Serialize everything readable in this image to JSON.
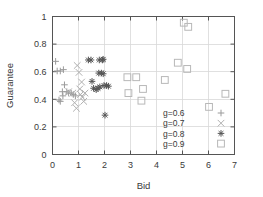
{
  "chart_data": {
    "type": "scatter",
    "title": "",
    "xlabel": "Bid",
    "ylabel": "Guarantee",
    "xlim": [
      0,
      7
    ],
    "ylim": [
      0,
      1
    ],
    "xticks": [
      "0",
      "1",
      "2",
      "3",
      "4",
      "5",
      "6",
      "7"
    ],
    "xtick_values": [
      0,
      1,
      2,
      3,
      4,
      5,
      6,
      7
    ],
    "yticks": [
      "0",
      "0.2",
      "0.4",
      "0.6",
      "0.8",
      "1"
    ],
    "ytick_values": [
      0,
      0.2,
      0.4,
      0.6,
      0.8,
      1
    ],
    "grid": true,
    "legend_position": "lower right",
    "series": [
      {
        "name": "g=0.6",
        "marker": "plus",
        "color": "#9a9a9a",
        "points": [
          [
            0.12,
            0.675
          ],
          [
            0.18,
            0.605
          ],
          [
            0.3,
            0.605
          ],
          [
            0.25,
            0.395
          ],
          [
            0.3,
            0.385
          ],
          [
            0.42,
            0.615
          ],
          [
            0.38,
            0.455
          ],
          [
            0.4,
            0.425
          ],
          [
            0.46,
            0.505
          ],
          [
            0.55,
            0.455
          ],
          [
            0.62,
            0.445
          ],
          [
            0.72,
            0.445
          ],
          [
            0.8,
            0.435
          ],
          [
            0.88,
            0.425
          ]
        ]
      },
      {
        "name": "g=0.7",
        "marker": "cross",
        "color": "#b0b0b0",
        "points": [
          [
            0.62,
            0.455
          ],
          [
            0.78,
            0.445
          ],
          [
            0.85,
            0.375
          ],
          [
            0.92,
            0.335
          ],
          [
            0.95,
            0.645
          ],
          [
            1.02,
            0.595
          ],
          [
            1.05,
            0.475
          ],
          [
            1.08,
            0.435
          ],
          [
            1.12,
            0.525
          ],
          [
            1.15,
            0.415
          ],
          [
            1.2,
            0.385
          ],
          [
            1.25,
            0.445
          ]
        ]
      },
      {
        "name": "g=0.8",
        "marker": "star",
        "color": "#555555",
        "points": [
          [
            1.38,
            0.685
          ],
          [
            1.48,
            0.685
          ],
          [
            1.8,
            0.685
          ],
          [
            1.92,
            0.685
          ],
          [
            1.95,
            0.69
          ],
          [
            1.52,
            0.53
          ],
          [
            1.78,
            0.59
          ],
          [
            1.88,
            0.59
          ],
          [
            1.95,
            0.585
          ],
          [
            1.58,
            0.48
          ],
          [
            1.68,
            0.47
          ],
          [
            1.75,
            0.48
          ],
          [
            1.82,
            0.49
          ],
          [
            1.98,
            0.5
          ],
          [
            2.08,
            0.5
          ],
          [
            2.15,
            0.495
          ],
          [
            2.02,
            0.285
          ]
        ]
      },
      {
        "name": "g=0.9",
        "marker": "square",
        "color": "#b8b8b8",
        "points": [
          [
            2.88,
            0.56
          ],
          [
            3.22,
            0.56
          ],
          [
            2.92,
            0.445
          ],
          [
            3.48,
            0.475
          ],
          [
            3.42,
            0.39
          ],
          [
            4.32,
            0.54
          ],
          [
            4.82,
            0.665
          ],
          [
            5.18,
            0.62
          ],
          [
            5.05,
            0.955
          ],
          [
            5.22,
            0.925
          ],
          [
            6.02,
            0.345
          ],
          [
            6.65,
            0.44
          ]
        ]
      }
    ]
  },
  "legend": {
    "entries": [
      {
        "label": "g=0.6",
        "marker": "plus"
      },
      {
        "label": "g=0.7",
        "marker": "cross"
      },
      {
        "label": "g=0.8",
        "marker": "star"
      },
      {
        "label": "g=0.9",
        "marker": "square"
      }
    ]
  }
}
